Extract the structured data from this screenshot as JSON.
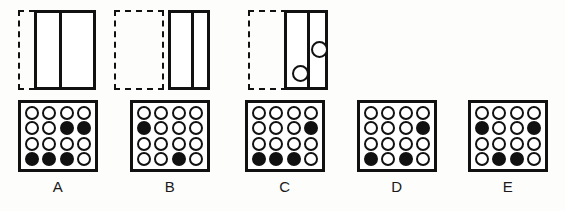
{
  "item": {
    "kind": "nonverbal-reasoning-matrix",
    "stroke_color": "#111111",
    "fill_color_filled": "#111111",
    "fill_color_empty": "#ffffff",
    "background": "#ffffff"
  },
  "stimuli": [
    {
      "name": "stimulus-1",
      "ghost": {
        "x": 18,
        "y": 0,
        "width": 28,
        "height": 80,
        "style": "dashed"
      },
      "panel": {
        "x": 34,
        "y": 0,
        "width": 62,
        "height": 80,
        "style": "solid"
      },
      "divider_offset": 22,
      "circles": []
    },
    {
      "name": "stimulus-2",
      "ghost": {
        "x": 114,
        "y": 0,
        "width": 50,
        "height": 80,
        "style": "dashed"
      },
      "panel": {
        "x": 168,
        "y": 0,
        "width": 42,
        "height": 80,
        "style": "solid"
      },
      "divider_offset": 20,
      "circles": []
    },
    {
      "name": "stimulus-3",
      "ghost": {
        "x": 248,
        "y": 0,
        "width": 50,
        "height": 80,
        "style": "dashed"
      },
      "panel": {
        "x": 284,
        "y": 0,
        "width": 44,
        "height": 80,
        "style": "solid"
      },
      "divider_offset": 20,
      "circles": [
        {
          "name": "circle-lower-left",
          "x": 5,
          "y": 52,
          "size": 17,
          "fill": "empty"
        },
        {
          "name": "circle-upper-right",
          "x": 24,
          "y": 28,
          "size": 17,
          "fill": "empty"
        }
      ]
    }
  ],
  "options": [
    {
      "label": "A",
      "x": 18,
      "grid": [
        [
          "empty",
          "empty",
          "empty",
          "empty"
        ],
        [
          "empty",
          "empty",
          "filled",
          "filled"
        ],
        [
          "empty",
          "empty",
          "empty",
          "empty"
        ],
        [
          "filled",
          "filled",
          "filled",
          "empty"
        ]
      ]
    },
    {
      "label": "B",
      "x": 130,
      "grid": [
        [
          "empty",
          "empty",
          "empty",
          "empty"
        ],
        [
          "filled",
          "empty",
          "empty",
          "empty"
        ],
        [
          "empty",
          "empty",
          "empty",
          "empty"
        ],
        [
          "empty",
          "empty",
          "filled",
          "empty"
        ]
      ]
    },
    {
      "label": "C",
      "x": 245,
      "grid": [
        [
          "empty",
          "empty",
          "empty",
          "empty"
        ],
        [
          "empty",
          "empty",
          "empty",
          "filled"
        ],
        [
          "empty",
          "empty",
          "empty",
          "empty"
        ],
        [
          "filled",
          "filled",
          "filled",
          "empty"
        ]
      ]
    },
    {
      "label": "D",
      "x": 357,
      "grid": [
        [
          "empty",
          "empty",
          "empty",
          "empty"
        ],
        [
          "empty",
          "empty",
          "empty",
          "filled"
        ],
        [
          "empty",
          "empty",
          "empty",
          "empty"
        ],
        [
          "filled",
          "empty",
          "filled",
          "empty"
        ]
      ]
    },
    {
      "label": "E",
      "x": 468,
      "grid": [
        [
          "empty",
          "empty",
          "empty",
          "empty"
        ],
        [
          "filled",
          "empty",
          "empty",
          "filled"
        ],
        [
          "empty",
          "empty",
          "empty",
          "empty"
        ],
        [
          "empty",
          "filled",
          "filled",
          "empty"
        ]
      ]
    }
  ]
}
